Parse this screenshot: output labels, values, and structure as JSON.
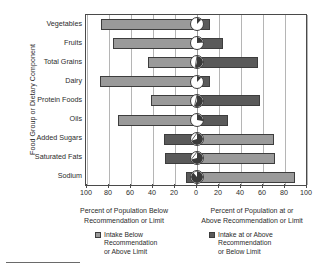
{
  "chart_data": {
    "type": "bar",
    "subtype": "diverging-horizontal-bar",
    "title": "",
    "xlabel_left": "Percent of Population Below Recommendation or Limit",
    "xlabel_right": "Percent of Population at or Above Recommendation or Limit",
    "ylabel": "Food Group or Dietary Component",
    "grid": true,
    "legend_position": "bottom",
    "xlim": [
      -100,
      100
    ],
    "xticks": [
      100,
      80,
      60,
      40,
      20,
      0,
      20,
      40,
      60,
      80,
      100
    ],
    "categories": [
      "Vegetables",
      "Fruits",
      "Total Grains",
      "Dairy",
      "Protein Foods",
      "Oils",
      "Added Sugars",
      "Saturated Fats",
      "Sodium"
    ],
    "series": [
      {
        "name": "Intake Below Recommendation or Above Limit",
        "color": "#9a9a9a",
        "values": [
          87,
          76,
          45,
          88,
          42,
          72,
          70,
          71,
          89
        ]
      },
      {
        "name": "Intake at or Above Recommendation or Below Limit",
        "color": "#5a5a5a",
        "values": [
          12,
          24,
          55,
          12,
          57,
          28,
          30,
          29,
          10
        ]
      }
    ],
    "rows": [
      {
        "category": "Vegetables",
        "left_value": 87,
        "left_side": "light",
        "right_value": 12,
        "right_side": "dark"
      },
      {
        "category": "Fruits",
        "left_value": 76,
        "left_side": "light",
        "right_value": 24,
        "right_side": "dark"
      },
      {
        "category": "Total Grains",
        "left_value": 45,
        "left_side": "light",
        "right_value": 55,
        "right_side": "dark"
      },
      {
        "category": "Dairy",
        "left_value": 88,
        "left_side": "light",
        "right_value": 12,
        "right_side": "dark"
      },
      {
        "category": "Protein Foods",
        "left_value": 42,
        "left_side": "light",
        "right_value": 57,
        "right_side": "dark"
      },
      {
        "category": "Oils",
        "left_value": 72,
        "left_side": "light",
        "right_value": 28,
        "right_side": "dark"
      },
      {
        "category": "Added Sugars",
        "left_value": 30,
        "left_side": "dark",
        "right_value": 70,
        "right_side": "light"
      },
      {
        "category": "Saturated Fats",
        "left_value": 29,
        "left_side": "dark",
        "right_value": 71,
        "right_side": "light"
      },
      {
        "category": "Sodium",
        "left_value": 10,
        "left_side": "dark",
        "right_value": 89,
        "right_side": "light"
      }
    ]
  },
  "axis": {
    "y_title": "Food Group or Dietary Component",
    "x_ticks": [
      "100",
      "80",
      "60",
      "40",
      "20",
      "0",
      "20",
      "40",
      "60",
      "80",
      "100"
    ],
    "x_label_left_line1": "Percent of Population Below",
    "x_label_left_line2": "Recommendation or Limit",
    "x_label_right_line1": "Percent of Population at or",
    "x_label_right_line2": "Above Recommendation or Limit"
  },
  "legend": {
    "items": [
      {
        "swatch": "light",
        "line1": "Intake Below",
        "line2": "Recommendation",
        "line3": "or Above Limit"
      },
      {
        "swatch": "dark",
        "line1": "Intake at or Above",
        "line2": "Recommendation",
        "line3": "or Below Limit"
      }
    ]
  },
  "colors": {
    "light_gray": "#9a9a9a",
    "dark_gray": "#5a5a5a",
    "axis": "#4a4a4a",
    "grid": "#b5b5b5"
  }
}
